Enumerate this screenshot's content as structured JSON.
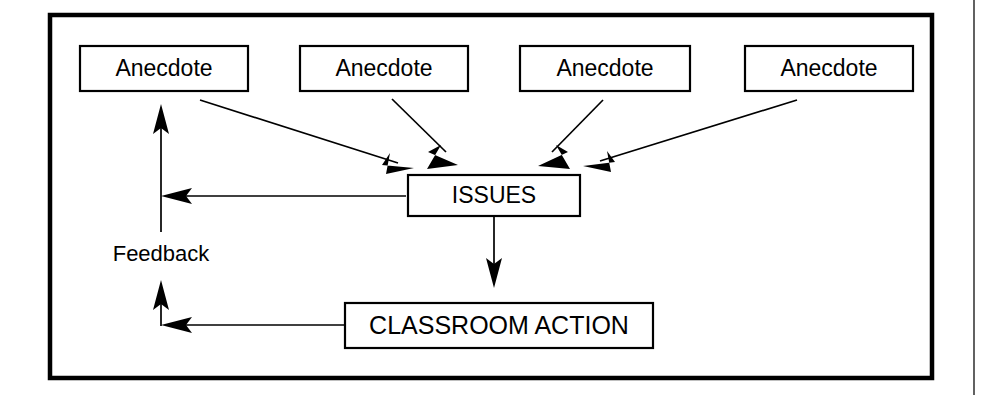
{
  "diagram": {
    "type": "flowchart",
    "title": "",
    "background_color": "#ffffff",
    "line_color": "#000000",
    "frame": {
      "name": "outer-border",
      "x": 50,
      "y": 15,
      "width": 882,
      "height": 363,
      "stroke_width": 4.5
    },
    "page_edge_line": {
      "x": 974,
      "y1": 0,
      "y2": 395,
      "color": "#3a3a3a"
    },
    "nodes": [
      {
        "id": "anecdote1",
        "label": "Anecdote",
        "x": 80,
        "y": 46,
        "width": 168,
        "height": 45
      },
      {
        "id": "anecdote2",
        "label": "Anecdote",
        "x": 300,
        "y": 46,
        "width": 168,
        "height": 45
      },
      {
        "id": "anecdote3",
        "label": "Anecdote",
        "x": 520,
        "y": 46,
        "width": 170,
        "height": 45
      },
      {
        "id": "anecdote4",
        "label": "Anecdote",
        "x": 745,
        "y": 46,
        "width": 168,
        "height": 45
      },
      {
        "id": "issues",
        "label": "ISSUES",
        "x": 408,
        "y": 175,
        "width": 172,
        "height": 41
      },
      {
        "id": "action",
        "label": "CLASSROOM ACTION",
        "x": 345,
        "y": 303,
        "width": 308,
        "height": 45
      }
    ],
    "annotations": [
      {
        "id": "feedback-label",
        "label": "Feedback",
        "x": 161,
        "y": 255
      }
    ],
    "edges": [
      {
        "id": "e-anecdote1-issues",
        "from": "anecdote1",
        "to": "issues",
        "style": "solid",
        "direction": "forward"
      },
      {
        "id": "e-anecdote2-issues",
        "from": "anecdote2",
        "to": "issues",
        "style": "solid",
        "direction": "forward"
      },
      {
        "id": "e-anecdote3-issues",
        "from": "anecdote3",
        "to": "issues",
        "style": "solid",
        "direction": "forward"
      },
      {
        "id": "e-anecdote4-issues",
        "from": "anecdote4",
        "to": "issues",
        "style": "solid",
        "direction": "forward"
      },
      {
        "id": "e-issues-action",
        "from": "issues",
        "to": "action",
        "style": "solid",
        "direction": "forward"
      },
      {
        "id": "e-issues-feedback",
        "from": "issues",
        "to": "feedback-channel",
        "style": "solid",
        "direction": "forward"
      },
      {
        "id": "e-action-feedback",
        "from": "action",
        "to": "feedback-channel",
        "style": "solid",
        "direction": "forward"
      },
      {
        "id": "e-feedback-anecdote1-upper",
        "from": "feedback-channel",
        "to": "anecdote1",
        "style": "solid",
        "direction": "forward"
      },
      {
        "id": "e-feedback-anecdote1-lower",
        "from": "feedback-channel",
        "to": "feedback-label",
        "style": "solid",
        "direction": "forward"
      }
    ]
  }
}
